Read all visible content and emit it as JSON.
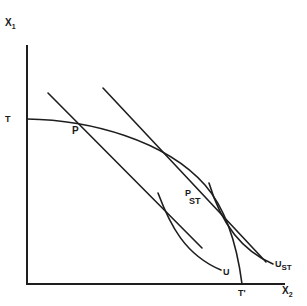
{
  "diagram": {
    "type": "economics-trade-diagram",
    "axes": {
      "y_label": "X",
      "y_sub": "1",
      "x_label": "X",
      "x_sub": "2"
    },
    "curves": {
      "ppf": {
        "name": "production possibility frontier",
        "start_label": "T",
        "end_label": "T'"
      },
      "price_line_p": {
        "name": "price line P"
      },
      "price_line_pst": {
        "name": "price line P_ST"
      },
      "indifference_u": {
        "label": "U"
      },
      "indifference_ust": {
        "label": "U",
        "sub": "ST"
      }
    },
    "points": {
      "p": {
        "label": "P"
      },
      "pst": {
        "label": "P",
        "sub": "ST"
      }
    },
    "colors": {
      "line": "#1e1e1e",
      "background": "#ffffff"
    }
  }
}
